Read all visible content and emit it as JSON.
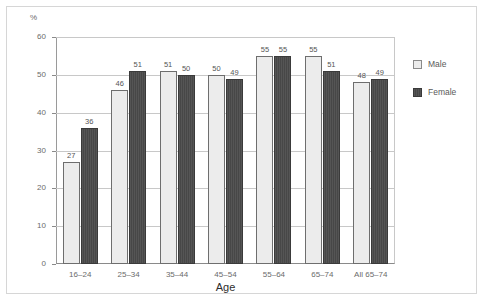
{
  "chart_data": {
    "type": "bar",
    "title": "",
    "xlabel": "Age",
    "ylabel": "%",
    "ylim": [
      0,
      60
    ],
    "ytick_labels": [
      "0",
      "10",
      "20",
      "30",
      "40",
      "50",
      "60"
    ],
    "ytick_values": [
      0,
      10,
      20,
      30,
      40,
      50,
      60
    ],
    "grid": true,
    "legend_position": "right",
    "categories": [
      "16–24",
      "25–34",
      "35–44",
      "45–54",
      "55–64",
      "65–74",
      "All 65–74"
    ],
    "series": [
      {
        "name": "Male",
        "color": "#ececec",
        "values": [
          27,
          46,
          51,
          50,
          55,
          55,
          48
        ],
        "value_labels": [
          "27",
          "46",
          "51",
          "50",
          "55",
          "55",
          "48"
        ]
      },
      {
        "name": "Female",
        "color": "#4f4f4f",
        "values": [
          36,
          51,
          50,
          49,
          55,
          51,
          49
        ],
        "value_labels": [
          "36",
          "51",
          "50",
          "49",
          "55",
          "51",
          "49"
        ]
      }
    ]
  },
  "legend": {
    "items": [
      {
        "label": "Male"
      },
      {
        "label": "Female"
      }
    ]
  },
  "colors": {
    "male_fill": "#ececec",
    "female_fill": "#4f4f4f",
    "axis": "#8a8a8a",
    "gridline": "#c8c8c8",
    "frame": "#d6d6d6",
    "text": "#6b6b6b"
  }
}
